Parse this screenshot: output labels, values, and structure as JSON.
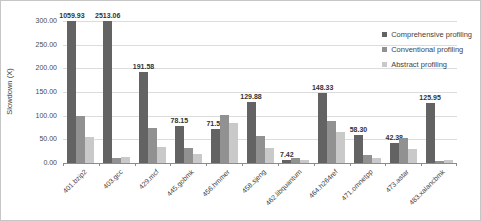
{
  "chart_data": {
    "type": "bar",
    "title": "",
    "ylabel": "Slowdown (X)",
    "xlabel": "",
    "ylim": [
      0,
      300
    ],
    "ytick_step": 50,
    "grid": true,
    "legend_position": "top-right",
    "note_bars_clipped_at": 300,
    "categories": [
      "401.bzip2",
      "403.gcc",
      "429.mcf",
      "445.gobmk",
      "456.hmmer",
      "458.sjeng",
      "462.libquantum",
      "464.h264ref",
      "471.omnetpp",
      "473.astar",
      "483.xalancbmk"
    ],
    "series": [
      {
        "name": "Comprehensive profiling",
        "color": "#636363",
        "data_labels": true,
        "values": [
          1059.93,
          2513.06,
          191.58,
          78.15,
          71.55,
          129.88,
          7.42,
          148.33,
          58.3,
          42.38,
          125.95
        ]
      },
      {
        "name": "Conventional profiling",
        "color": "#919191",
        "data_labels": false,
        "values": [
          100,
          10,
          75,
          32,
          101,
          57,
          10,
          89,
          17,
          52,
          4
        ]
      },
      {
        "name": "Abstract profiling",
        "color": "#c9c9c9",
        "data_labels": false,
        "values": [
          55,
          13,
          34,
          19,
          85,
          31,
          7,
          65,
          10,
          30,
          7
        ]
      }
    ]
  }
}
